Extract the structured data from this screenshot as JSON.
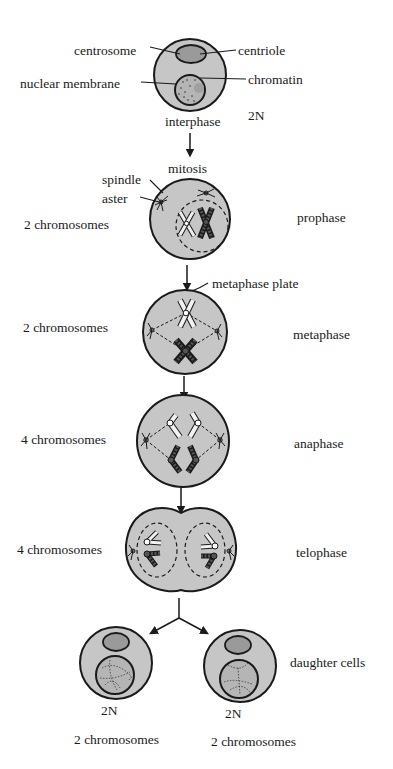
{
  "diagram": {
    "colors": {
      "cell_fill": "#c6c6c6",
      "nucleus_fill": "#b5b5b5",
      "centrosome_fill": "#9a9a9a",
      "outline": "#1a1a1a",
      "background": "#ffffff"
    },
    "interphase": {
      "labels": {
        "centrosome": "centrosome",
        "centriole": "centriole",
        "nuclear_membrane": "nuclear membrane",
        "chromatin": "chromatin",
        "ploidy": "2N",
        "stage": "interphase"
      }
    },
    "transition_label": "mitosis",
    "prophase": {
      "labels": {
        "spindle": "spindle",
        "aster": "aster",
        "count": "2 chromosomes",
        "stage": "prophase"
      }
    },
    "metaphase": {
      "labels": {
        "plate": "metaphase plate",
        "count": "2 chromosomes",
        "stage": "metaphase"
      }
    },
    "anaphase": {
      "labels": {
        "count": "4 chromosomes",
        "stage": "anaphase"
      }
    },
    "telophase": {
      "labels": {
        "count": "4 chromosomes",
        "stage": "telophase"
      }
    },
    "daughter_cells": {
      "stage": "daughter cells",
      "left": {
        "ploidy": "2N",
        "count": "2 chromosomes"
      },
      "right": {
        "ploidy": "2N",
        "count": "2 chromosomes"
      }
    }
  }
}
